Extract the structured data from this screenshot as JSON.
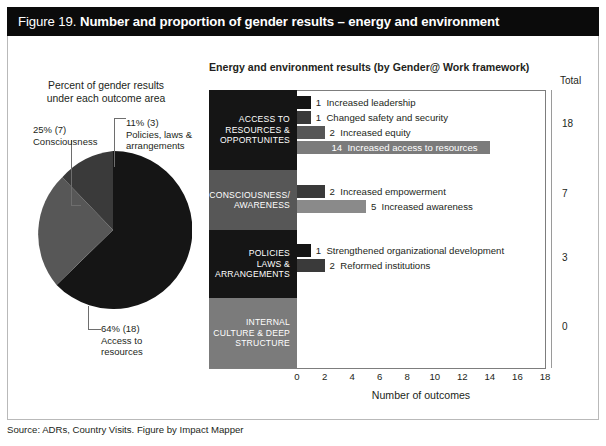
{
  "figure": {
    "number": "Figure 19.",
    "title": "Number and proportion of gender results – energy and environment",
    "source": "Source: ADRs, Country Visits. Figure by Impact Mapper"
  },
  "colors": {
    "header_bg": "#0b0b0b",
    "black": "#151515",
    "dark_gray": "#3a3a3a",
    "mid_gray": "#575757",
    "light_gray": "#7b7b7b",
    "leader_line": "#6e6e6e",
    "axis": "#7d7d7d"
  },
  "pie": {
    "title": "Percent of gender results\nunder each outcome area",
    "title_line1": "Percent of gender results",
    "title_line2": "under each outcome area",
    "labels": {
      "consciousness": "25% (7)\nConsciousness",
      "consciousness_l1": "25% (7)",
      "consciousness_l2": "Consciousness",
      "policies": "11% (3)\nPolicies, laws &\narrangements",
      "policies_l1": "11% (3)",
      "policies_l2": "Policies, laws &",
      "policies_l3": "arrangements",
      "access": "64% (18)\nAccess to\nresources",
      "access_l1": "64% (18)",
      "access_l2": "Access to",
      "access_l3": "resources"
    }
  },
  "bar_chart": {
    "title": "Energy and environment results (by Gender@ Work framework)",
    "total_header": "Total",
    "xaxis_title": "Number of outcomes"
  },
  "chart_data": [
    {
      "type": "pie",
      "title": "Percent of gender results under each outcome area",
      "categories": [
        "Access to resources",
        "Consciousness",
        "Policies, laws & arrangements"
      ],
      "values": [
        64,
        25,
        11
      ],
      "counts": [
        18,
        7,
        3
      ],
      "labels": [
        "64% (18)",
        "25% (7)",
        "11% (3)"
      ],
      "colors": [
        "#151515",
        "#575757",
        "#3a3a3a"
      ],
      "legend": "none"
    },
    {
      "type": "bar",
      "orientation": "horizontal",
      "title": "Energy and environment results (by Gender@ Work framework)",
      "xlabel": "Number of outcomes",
      "ylabel": "",
      "xlim": [
        0,
        18
      ],
      "xticks": [
        0,
        2,
        4,
        6,
        8,
        10,
        12,
        14,
        16,
        18
      ],
      "grid": false,
      "legend": "none",
      "groups": [
        {
          "name": "ACCESS TO RESOURCES & OPPORTUNITES",
          "name_lines": [
            "ACCESS TO",
            "RESOURCES &",
            "OPPORTUNITES"
          ],
          "block_color": "#151515",
          "total": 18,
          "bars": [
            {
              "label": "Increased leadership",
              "value": 1,
              "color": "#151515"
            },
            {
              "label": "Changed safety and security",
              "value": 1,
              "color": "#3a3a3a"
            },
            {
              "label": "Increased equity",
              "value": 2,
              "color": "#575757"
            },
            {
              "label": "Increased access to resources",
              "value": 14,
              "color": "#7b7b7b"
            }
          ]
        },
        {
          "name": "CONSCIOUSNESS/ AWARENESS",
          "name_lines": [
            "CONSCIOUSNESS/",
            "AWARENESS"
          ],
          "block_color": "#575757",
          "total": 7,
          "bars": [
            {
              "label": "Increased empowerment",
              "value": 2,
              "color": "#3a3a3a"
            },
            {
              "label": "Increased awareness",
              "value": 5,
              "color": "#8a8a8a"
            }
          ]
        },
        {
          "name": "POLICIES LAWS & ARRANGEMENTS",
          "name_lines": [
            "POLICIES",
            "LAWS &",
            "ARRANGEMENTS"
          ],
          "block_color": "#151515",
          "total": 3,
          "bars": [
            {
              "label": "Strengthened organizational development",
              "value": 1,
              "color": "#151515"
            },
            {
              "label": "Reformed institutions",
              "value": 2,
              "color": "#3a3a3a"
            }
          ]
        },
        {
          "name": "INTERNAL CULTURE & DEEP STRUCTURE",
          "name_lines": [
            "INTERNAL",
            "CULTURE & DEEP",
            "STRUCTURE"
          ],
          "block_color": "#7b7b7b",
          "total": 0,
          "bars": []
        }
      ]
    }
  ]
}
